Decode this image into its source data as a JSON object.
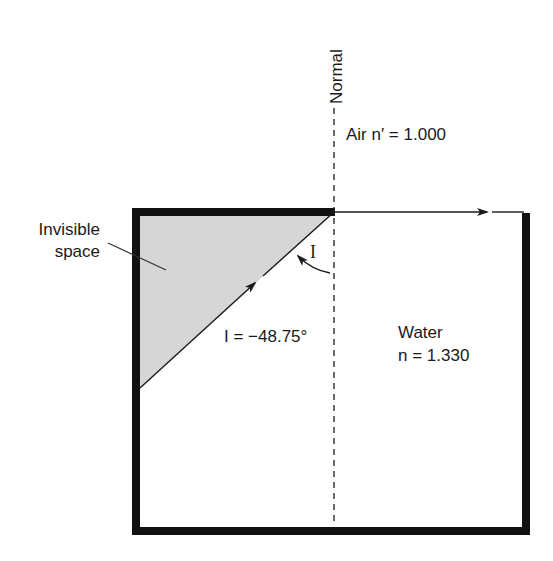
{
  "diagram": {
    "type": "refraction-total-internal-reflection",
    "labels": {
      "normal": "Normal",
      "air": "Air n′ = 1.000",
      "water_line1": "Water",
      "water_line2": "n = 1.330",
      "invisible_line1": "Invisible",
      "invisible_line2": "space",
      "angle_symbol": "I",
      "angle_value": "I = −48.75°"
    },
    "media": [
      {
        "name": "Air",
        "symbol": "n′",
        "index": 1.0
      },
      {
        "name": "Water",
        "symbol": "n",
        "index": 1.33
      }
    ],
    "incidence_angle_deg": -48.75,
    "colors": {
      "line": "#1a1a1a",
      "border": "#111111",
      "shaded_region": "#d6d6d6",
      "background": "#ffffff"
    }
  }
}
